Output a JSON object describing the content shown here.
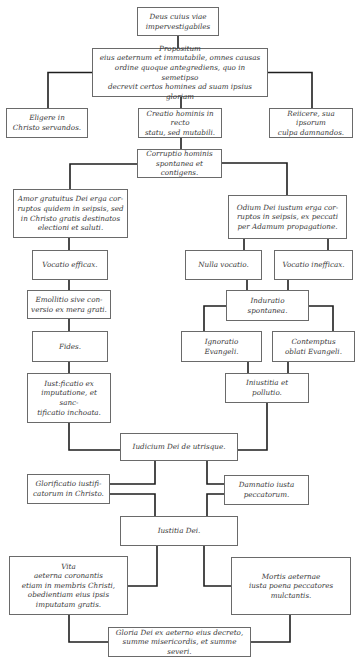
{
  "diagram": {
    "type": "flowchart",
    "line_color": "#1e1e1e",
    "box_border_color": "#6a6a6a",
    "text_color": "#3a3a3a",
    "nodes": [
      {
        "id": "deus",
        "text": "Deus cuius viae\nimpervestigabiles",
        "x": 137,
        "y": 7,
        "w": 82,
        "h": 29
      },
      {
        "id": "propositum",
        "text": "Propositum\neius aeternum et immutabile, omnes causas\nordine quoque antegrediens, quo in semetipso\ndecrevit certos homines ad suam ipsius gloriam",
        "x": 92,
        "y": 48,
        "w": 176,
        "h": 49
      },
      {
        "id": "eligere",
        "text": "Eligere in\nChristo servandos.",
        "x": 6,
        "y": 108,
        "w": 82,
        "h": 30
      },
      {
        "id": "creatio",
        "text": "Creatio hominis in recto\nstatu, sed mutabili.",
        "x": 138,
        "y": 108,
        "w": 84,
        "h": 30
      },
      {
        "id": "reiicere",
        "text": "Reiicere, sua ipsorum\nculpa damnandos.",
        "x": 269,
        "y": 108,
        "w": 84,
        "h": 30
      },
      {
        "id": "corruptio",
        "text": "Corruptio hominis\nspontanea et contigens.",
        "x": 137,
        "y": 149,
        "w": 85,
        "h": 29
      },
      {
        "id": "amor",
        "text": "Amor gratuitus Dei erga cor-\nruptos quidem in seipsis, sed\nin Christo gratis destinatos\nelectioni et saluti.",
        "x": 13,
        "y": 189,
        "w": 115,
        "h": 49
      },
      {
        "id": "odium",
        "text": "Odium Dei iustum erga cor-\nruptos in seipsis, ex peccati\nper Adamum propagatione.",
        "x": 228,
        "y": 195,
        "w": 119,
        "h": 44
      },
      {
        "id": "vocatio_efficax",
        "text": "Vocatio efficax.",
        "x": 32,
        "y": 250,
        "w": 76,
        "h": 30
      },
      {
        "id": "nulla_vocatio",
        "text": "Nulla vocatio.",
        "x": 185,
        "y": 250,
        "w": 77,
        "h": 30
      },
      {
        "id": "vocatio_inefficax",
        "text": "Vocatio inefficax.",
        "x": 274,
        "y": 250,
        "w": 79,
        "h": 30
      },
      {
        "id": "emollitio",
        "text": "Emollitio sive con-\nversio ex mera grati.",
        "x": 27,
        "y": 290,
        "w": 84,
        "h": 29
      },
      {
        "id": "induratio",
        "text": "Induratio\nspontanea.",
        "x": 226,
        "y": 290,
        "w": 83,
        "h": 31
      },
      {
        "id": "fides",
        "text": "Fides.",
        "x": 32,
        "y": 331,
        "w": 76,
        "h": 31
      },
      {
        "id": "ignoratio",
        "text": "Ignoratio\nEvangeli.",
        "x": 181,
        "y": 331,
        "w": 81,
        "h": 31
      },
      {
        "id": "contemptus",
        "text": "Contemptus\noblati Evangeli.",
        "x": 272,
        "y": 331,
        "w": 83,
        "h": 31
      },
      {
        "id": "iustificatio",
        "text": "Iust:ficatio ex\nimputatione, et sanc-\ntificatio inchoata.",
        "x": 27,
        "y": 373,
        "w": 84,
        "h": 50
      },
      {
        "id": "iniustitia",
        "text": "Iniustitia et\npollutio.",
        "x": 225,
        "y": 373,
        "w": 84,
        "h": 30
      },
      {
        "id": "iudicium",
        "text": "Iudicium Dei de utrisque.",
        "x": 120,
        "y": 433,
        "w": 118,
        "h": 28
      },
      {
        "id": "glorificatio",
        "text": "Glorificatio iustifi-\ncatorum in Christo.",
        "x": 27,
        "y": 474,
        "w": 83,
        "h": 30
      },
      {
        "id": "damnatio",
        "text": "Damnatio iusta\npeccatorum.",
        "x": 224,
        "y": 475,
        "w": 85,
        "h": 30
      },
      {
        "id": "iustitia",
        "text": "Iustitia Dei.",
        "x": 120,
        "y": 516,
        "w": 118,
        "h": 30
      },
      {
        "id": "vita",
        "text": "Vita\naeterna coronantis\netiam in membris Christi,\nobedientiam eius ipsis\nimputatam gratis.",
        "x": 9,
        "y": 556,
        "w": 119,
        "h": 59
      },
      {
        "id": "mortis",
        "text": "Mortis aeternae\niusta poena peccatores\nmulctantis.",
        "x": 231,
        "y": 557,
        "w": 120,
        "h": 58
      },
      {
        "id": "gloria",
        "text": "Gloria Dei ex aeterno eius decreto,\nsumme misericordis, et summe severi.",
        "x": 108,
        "y": 627,
        "w": 143,
        "h": 30
      }
    ],
    "connectors": [
      {
        "from": "deus",
        "to": "propositum",
        "d": "M178 36 V48"
      },
      {
        "from": "propositum",
        "to": "eligere",
        "d": "M92 72.5 H48 V108"
      },
      {
        "from": "propositum",
        "to": "creatio",
        "d": "M181 97 V108"
      },
      {
        "from": "propositum",
        "to": "reiicere",
        "d": "M268 72.5 H312 V108"
      },
      {
        "from": "creatio",
        "to": "corruptio",
        "d": "M181 138 V149"
      },
      {
        "from": "corruptio",
        "to": "amor",
        "d": "M137 164 H70 V189"
      },
      {
        "from": "corruptio",
        "to": "odium",
        "d": "M222 163 H287 V195"
      },
      {
        "from": "amor",
        "to": "vocatio_efficax",
        "d": "M69 238 V250"
      },
      {
        "from": "odium",
        "to": "nulla_vocatio",
        "d": "M244 239 V250"
      },
      {
        "from": "odium",
        "to": "vocatio_inefficax",
        "d": "M328 239 V250"
      },
      {
        "from": "vocatio_efficax",
        "to": "emollitio",
        "d": "M69 280 V290"
      },
      {
        "from": "nulla_vocatio",
        "to": "induratio",
        "d": "M247 280 V290"
      },
      {
        "from": "vocatio_inefficax",
        "to": "induratio",
        "d": "M288 280 V290"
      },
      {
        "from": "emollitio",
        "to": "fides",
        "d": "M69 319 V331"
      },
      {
        "from": "induratio",
        "to": "ignoratio",
        "d": "M226 306 H204 V331"
      },
      {
        "from": "induratio",
        "to": "contemptus",
        "d": "M309 306 H333 V331"
      },
      {
        "from": "fides",
        "to": "iustificatio",
        "d": "M69 362 V373"
      },
      {
        "from": "ignoratio",
        "to": "iniustitia",
        "d": "M248 362 V373"
      },
      {
        "from": "contemptus",
        "to": "iniustitia",
        "d": "M288 362 V373"
      },
      {
        "from": "iustificatio",
        "to": "iudicium",
        "d": "M69 423 V450 H120"
      },
      {
        "from": "iniustitia",
        "to": "iudicium",
        "d": "M267 403 V450 H238"
      },
      {
        "from": "iudicium",
        "to": "glorificatio",
        "d": "M155 461 V484 H110"
      },
      {
        "from": "iudicium",
        "to": "damnatio",
        "d": "M207 461 V484 H224"
      },
      {
        "from": "glorificatio",
        "to": "iustitia",
        "d": "M110 494 H155 V516"
      },
      {
        "from": "damnatio",
        "to": "iustitia",
        "d": "M224 494 H207 V516"
      },
      {
        "from": "iustitia",
        "to": "vita",
        "d": "M157 546 V586 H128"
      },
      {
        "from": "iustitia",
        "to": "mortis",
        "d": "M204 546 V586 H231"
      },
      {
        "from": "vita",
        "to": "gloria",
        "d": "M69 615 V642 H108"
      },
      {
        "from": "mortis",
        "to": "gloria",
        "d": "M290 615 V642 H251"
      }
    ]
  }
}
